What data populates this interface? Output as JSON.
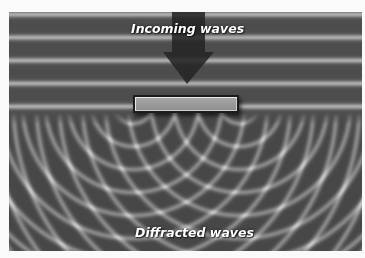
{
  "figure": {
    "incoming_label": "Incoming waves",
    "diffracted_label": "Diffracted waves"
  },
  "colors": {
    "background": "#fafafa",
    "wave_light": "#bdbdbd",
    "wave_dark": "#3a3a3a",
    "arrow": "#2a2a2a",
    "barrier_fill": "#9a9a9a",
    "label_text": "#ffffff"
  }
}
